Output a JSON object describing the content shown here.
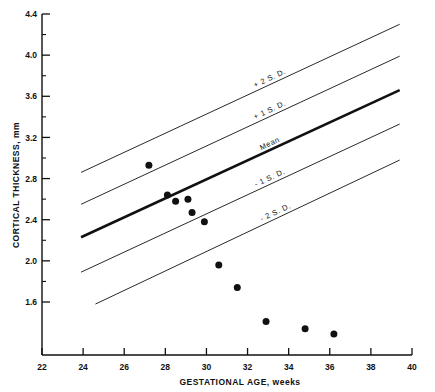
{
  "chart_data": {
    "type": "scatter",
    "title": "",
    "xlabel": "GESTATIONAL AGE, weeks",
    "ylabel": "CORTICAL THICKNESS, mm",
    "xlim": [
      22,
      40
    ],
    "ylim": [
      1.085,
      4.4
    ],
    "xticks": [
      22,
      24,
      26,
      28,
      30,
      32,
      34,
      36,
      38,
      40
    ],
    "xtick_labels": [
      "22",
      "24",
      "26",
      "28",
      "30",
      "32",
      "34",
      "36",
      "38",
      "40"
    ],
    "yticks": [
      1.6,
      2.0,
      2.4,
      2.8,
      3.2,
      3.6,
      4.0,
      4.4
    ],
    "ytick_labels": [
      "1.6",
      "2.0",
      "2.4",
      "2.8",
      "3.2",
      "3.6",
      "4.0",
      "4.4"
    ],
    "yminor_ticks": [
      1.8,
      2.2,
      2.6,
      3.0,
      3.4,
      3.8,
      4.2
    ],
    "grid": false,
    "legend_position": "inline-annotations",
    "marker_color": "#111111",
    "marker_size_px": 7,
    "line_color": "#111111",
    "points": [
      {
        "x": 27.2,
        "y": 2.93
      },
      {
        "x": 28.1,
        "y": 2.64
      },
      {
        "x": 28.5,
        "y": 2.58
      },
      {
        "x": 29.1,
        "y": 2.6
      },
      {
        "x": 29.3,
        "y": 2.47
      },
      {
        "x": 29.9,
        "y": 2.38
      },
      {
        "x": 30.6,
        "y": 1.96
      },
      {
        "x": 31.5,
        "y": 1.74
      },
      {
        "x": 32.9,
        "y": 1.41
      },
      {
        "x": 34.8,
        "y": 1.34
      },
      {
        "x": 36.2,
        "y": 1.29
      }
    ],
    "reference_lines": [
      {
        "name": "+2 S.D.",
        "label": "+ 2 S. D.",
        "x_start": 23.9,
        "y_start": 2.86,
        "x_end": 39.4,
        "y_end": 4.3,
        "weight": "thin"
      },
      {
        "name": "+1 S.D.",
        "label": "+ 1 S. D.",
        "x_start": 23.9,
        "y_start": 2.55,
        "x_end": 39.4,
        "y_end": 3.99,
        "weight": "thin"
      },
      {
        "name": "Mean",
        "label": "Mean",
        "x_start": 23.9,
        "y_start": 2.23,
        "x_end": 39.4,
        "y_end": 3.66,
        "weight": "thick"
      },
      {
        "name": "-1 S.D.",
        "label": "- 1 S. D.",
        "x_start": 23.9,
        "y_start": 1.89,
        "x_end": 39.4,
        "y_end": 3.33,
        "weight": "thin"
      },
      {
        "name": "-2 S.D.",
        "label": "- 2 S. D.",
        "x_start": 24.6,
        "y_start": 1.58,
        "x_end": 39.4,
        "y_end": 2.98,
        "weight": "thin"
      }
    ]
  }
}
